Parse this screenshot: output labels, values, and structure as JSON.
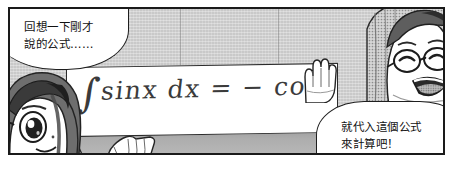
{
  "panel": {
    "type": "manga-panel",
    "border_color": "#1a1a1a",
    "background_color": "#c9c9c9"
  },
  "bubbles": [
    {
      "id": "recall",
      "name": "speech-bubble-recall",
      "text": "回想一下剛才\n說的公式……",
      "speaker": "left-girl",
      "position": "top-left"
    },
    {
      "id": "plug",
      "name": "speech-bubble-plug-in",
      "text": "就代入這個公式\n來計算吧！",
      "speaker": "right-girl-with-glasses",
      "position": "bottom-right"
    }
  ],
  "whiteboard": {
    "name": "whiteboard",
    "formula_integral_sign": "∫",
    "formula_body": "sinx dx  =  − cosx",
    "formula_full": "∫ sinx dx = − cosx",
    "ink_color": "#3b3b3b",
    "surface_color": "#ffffff"
  },
  "characters": [
    {
      "id": "left",
      "name": "character-left-girl",
      "description": "girl with long dark hair, large eyes, lower-left corner"
    },
    {
      "id": "right",
      "name": "character-right-girl-glasses",
      "description": "smiling girl wearing round glasses, long hair, upper-right corner"
    }
  ],
  "hands": [
    {
      "id": "right",
      "name": "hand-raised-right",
      "description": "open palm near board right edge"
    },
    {
      "id": "left",
      "name": "hand-pointing-left",
      "description": "open hand on desk below board"
    }
  ],
  "desk": {
    "name": "desk-surface",
    "color": "#adadad"
  }
}
